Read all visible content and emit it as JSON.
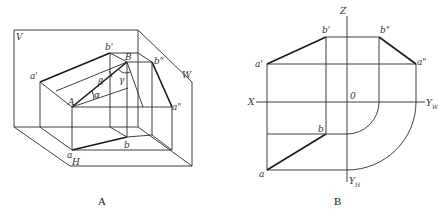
{
  "figure_a": {
    "caption": "A",
    "plane_labels": {
      "v": "V",
      "w": "W",
      "h": "H"
    },
    "point_labels": {
      "a_prime": "a'",
      "b_prime": "b'",
      "b_double_prime": "b\"",
      "a_double_prime": "a\"",
      "A": "A",
      "B": "B",
      "a": "a",
      "b": "b"
    },
    "angle_labels": {
      "alpha": "α",
      "beta": "β",
      "gamma": "γ"
    }
  },
  "figure_b": {
    "caption": "B",
    "axis_labels": {
      "x": "X",
      "z": "Z",
      "origin": "0",
      "y": "Y",
      "y_w_sub": "W",
      "y_h_sub": "H"
    },
    "point_labels": {
      "a_prime": "a'",
      "b_prime": "b'",
      "b_double_prime": "b\"",
      "a_double_prime": "a\"",
      "a": "a",
      "b": "b"
    }
  }
}
